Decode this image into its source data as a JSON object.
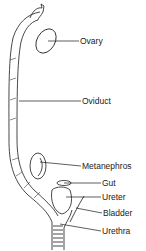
{
  "diagram": {
    "labels": [
      {
        "id": "ovary",
        "text": "Ovary",
        "x": 80,
        "y": 37
      },
      {
        "id": "oviduct",
        "text": "Oviduct",
        "x": 82,
        "y": 97
      },
      {
        "id": "metanephros",
        "text": "Metanephros",
        "x": 82,
        "y": 163
      },
      {
        "id": "gut",
        "text": "Gut",
        "x": 102,
        "y": 180
      },
      {
        "id": "ureter",
        "text": "Ureter",
        "x": 102,
        "y": 194
      },
      {
        "id": "bladder",
        "text": "Bladder",
        "x": 103,
        "y": 210
      },
      {
        "id": "urethra",
        "text": "Urethra",
        "x": 102,
        "y": 228
      }
    ],
    "colors": {
      "ink": "#1a1a1a",
      "background": "#ffffff"
    }
  }
}
